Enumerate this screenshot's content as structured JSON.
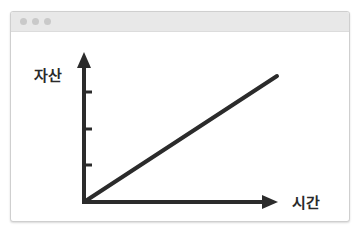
{
  "window": {
    "titlebar_dots": [
      "dot-1",
      "dot-2",
      "dot-3"
    ]
  },
  "diagram": {
    "y_axis_label": "자산",
    "x_axis_label": "시간",
    "y_axis_ticks": 3,
    "line": {
      "from": "origin",
      "direction": "increasing",
      "description": "자산이 시간에 따라 선형적으로 증가"
    },
    "colors": {
      "stroke": "#2b2b2b",
      "frame": "#cfcfcf",
      "titlebar": "#e8e8e8"
    }
  }
}
